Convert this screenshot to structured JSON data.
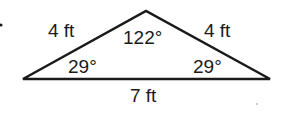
{
  "figure": {
    "shape": "isosceles-triangle",
    "side_labels": {
      "left": "4 ft",
      "right": "4 ft",
      "base": "7 ft"
    },
    "angle_labels": {
      "apex": "122°",
      "base_left": "29°",
      "base_right": "29°"
    },
    "stroke_color": "#1a1a1a"
  }
}
